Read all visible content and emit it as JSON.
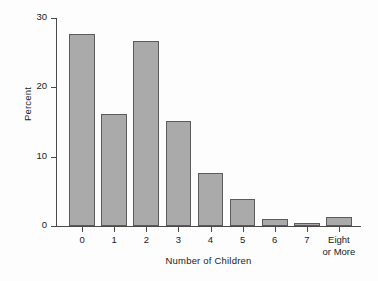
{
  "chart_data": {
    "type": "bar",
    "title": "",
    "xlabel": "Number of Children",
    "ylabel": "Percent",
    "categories": [
      "0",
      "1",
      "2",
      "3",
      "4",
      "5",
      "6",
      "7",
      "Eight\nor More"
    ],
    "values": [
      27.7,
      16.2,
      26.7,
      15.1,
      7.7,
      3.9,
      1.0,
      0.4,
      1.3
    ],
    "ylim": [
      0,
      30
    ],
    "yticks": [
      0,
      10,
      20,
      30
    ],
    "ytick_labels": [
      "0",
      "10",
      "20",
      "30"
    ],
    "grid": false,
    "legend": null,
    "bar_color": "#aaaaaa",
    "bar_edge_color": "#5b5b5b",
    "axis_color": "#4a4a4a",
    "background": "#fdfdfd"
  }
}
